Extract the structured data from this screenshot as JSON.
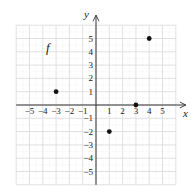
{
  "chart_data": {
    "type": "scatter",
    "title": "",
    "function_label": "f",
    "xlabel": "x",
    "ylabel": "y",
    "xlim": [
      -6,
      6
    ],
    "ylim": [
      -6,
      6
    ],
    "grid": true,
    "legend": "none",
    "x_ticks": [
      -5,
      -4,
      -3,
      -2,
      -1,
      1,
      2,
      3,
      4,
      5
    ],
    "y_ticks": [
      -5,
      -4,
      -3,
      -2,
      -1,
      1,
      2,
      3,
      4,
      5
    ],
    "x_tick_labels": [
      "−5",
      "−4",
      "−3",
      "−2",
      "−1",
      "1",
      "2",
      "3",
      "4",
      "5"
    ],
    "y_tick_labels": [
      "−5",
      "−4",
      "−3",
      "−2",
      "−1",
      "1",
      "2",
      "3",
      "4",
      "5"
    ],
    "series": [
      {
        "name": "f",
        "points": [
          {
            "x": -3,
            "y": 1
          },
          {
            "x": 1,
            "y": -2
          },
          {
            "x": 3,
            "y": 0
          },
          {
            "x": 4,
            "y": 5
          }
        ]
      }
    ]
  },
  "colors": {
    "grid_major": "#d9d9d9",
    "grid_minor": "#ececec",
    "axis": "#333333",
    "point": "#111111"
  }
}
